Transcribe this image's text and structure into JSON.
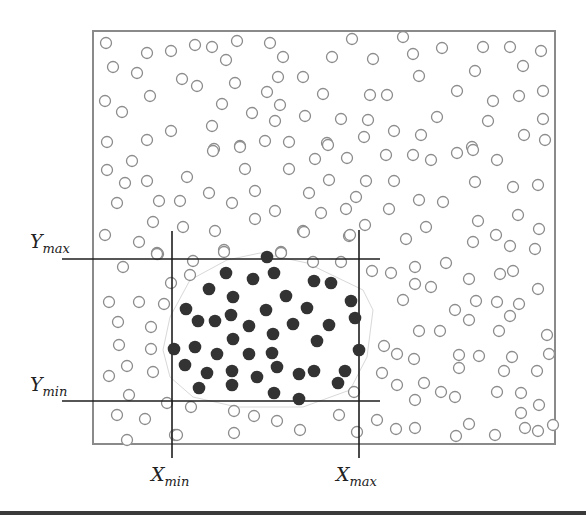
{
  "diagram": {
    "frame": {
      "x": 93,
      "y": 31,
      "w": 462,
      "h": 413,
      "stroke": "#8a8a8a"
    },
    "colors": {
      "open_stroke": "#8c8c8c",
      "filled": "#333333",
      "lines": "#1e1e1e",
      "hull": "#d8d8d8"
    },
    "dot_radius": 5.5,
    "labels": {
      "y_max": {
        "base": "Y",
        "sub": "max"
      },
      "y_min": {
        "base": "Y",
        "sub": "min"
      },
      "x_min": {
        "base": "X",
        "sub": "min"
      },
      "x_max": {
        "base": "X",
        "sub": "max"
      }
    },
    "bounds_lines": {
      "y_max": {
        "y": 259,
        "x1": 62,
        "x2": 380
      },
      "y_min": {
        "y": 401,
        "x1": 62,
        "x2": 380
      },
      "x_min": {
        "x": 172,
        "y1": 231,
        "y2": 458
      },
      "x_max": {
        "x": 359,
        "y1": 230,
        "y2": 458
      }
    },
    "hull_polygon": [
      [
        260,
        253
      ],
      [
        307,
        263
      ],
      [
        363,
        290
      ],
      [
        373,
        310
      ],
      [
        367,
        357
      ],
      [
        350,
        390
      ],
      [
        303,
        407
      ],
      [
        237,
        407
      ],
      [
        193,
        397
      ],
      [
        170,
        377
      ],
      [
        163,
        350
      ],
      [
        170,
        317
      ],
      [
        190,
        280
      ],
      [
        227,
        260
      ]
    ],
    "filled_points": [
      [
        267,
        257
      ],
      [
        226,
        273
      ],
      [
        253,
        279
      ],
      [
        274,
        273
      ],
      [
        314,
        281
      ],
      [
        331,
        283
      ],
      [
        209,
        289
      ],
      [
        233,
        297
      ],
      [
        286,
        296
      ],
      [
        351,
        301
      ],
      [
        186,
        309
      ],
      [
        266,
        310
      ],
      [
        307,
        308
      ],
      [
        198,
        321
      ],
      [
        215,
        321
      ],
      [
        231,
        315
      ],
      [
        249,
        326
      ],
      [
        293,
        324
      ],
      [
        329,
        325
      ],
      [
        355,
        318
      ],
      [
        233,
        339
      ],
      [
        273,
        334
      ],
      [
        317,
        341
      ],
      [
        174,
        349
      ],
      [
        195,
        347
      ],
      [
        217,
        354
      ],
      [
        249,
        354
      ],
      [
        272,
        353
      ],
      [
        359,
        350
      ],
      [
        185,
        365
      ],
      [
        277,
        367
      ],
      [
        207,
        373
      ],
      [
        232,
        371
      ],
      [
        257,
        377
      ],
      [
        299,
        374
      ],
      [
        314,
        371
      ],
      [
        345,
        371
      ],
      [
        199,
        388
      ],
      [
        232,
        385
      ],
      [
        338,
        383
      ],
      [
        274,
        393
      ],
      [
        299,
        399
      ]
    ],
    "open_points": [
      [
        106,
        43
      ],
      [
        147,
        53
      ],
      [
        171,
        51
      ],
      [
        195,
        45
      ],
      [
        212,
        47
      ],
      [
        237,
        41
      ],
      [
        270,
        43
      ],
      [
        283,
        57
      ],
      [
        226,
        60
      ],
      [
        113,
        67
      ],
      [
        137,
        73
      ],
      [
        182,
        79
      ],
      [
        197,
        86
      ],
      [
        235,
        83
      ],
      [
        278,
        77
      ],
      [
        303,
        77
      ],
      [
        323,
        94
      ],
      [
        267,
        92
      ],
      [
        280,
        105
      ],
      [
        150,
        96
      ],
      [
        105,
        101
      ],
      [
        122,
        112
      ],
      [
        222,
        104
      ],
      [
        252,
        113
      ],
      [
        275,
        121
      ],
      [
        305,
        116
      ],
      [
        171,
        131
      ],
      [
        212,
        126
      ],
      [
        107,
        142
      ],
      [
        147,
        140
      ],
      [
        214,
        149
      ],
      [
        240,
        146
      ],
      [
        265,
        141
      ],
      [
        289,
        142
      ],
      [
        327,
        143
      ],
      [
        352,
        39
      ],
      [
        403,
        37
      ],
      [
        332,
        57
      ],
      [
        373,
        59
      ],
      [
        413,
        54
      ],
      [
        442,
        48
      ],
      [
        483,
        47
      ],
      [
        510,
        47
      ],
      [
        541,
        51
      ],
      [
        523,
        66
      ],
      [
        475,
        71
      ],
      [
        419,
        76
      ],
      [
        370,
        95
      ],
      [
        387,
        95
      ],
      [
        457,
        91
      ],
      [
        493,
        101
      ],
      [
        519,
        96
      ],
      [
        543,
        91
      ],
      [
        341,
        119
      ],
      [
        368,
        120
      ],
      [
        437,
        117
      ],
      [
        488,
        121
      ],
      [
        543,
        119
      ],
      [
        364,
        137
      ],
      [
        394,
        131
      ],
      [
        421,
        135
      ],
      [
        524,
        135
      ],
      [
        545,
        140
      ],
      [
        472,
        147
      ],
      [
        213,
        151
      ],
      [
        240,
        147
      ],
      [
        132,
        161
      ],
      [
        107,
        170
      ],
      [
        245,
        169
      ],
      [
        289,
        169
      ],
      [
        315,
        159
      ],
      [
        125,
        183
      ],
      [
        147,
        181
      ],
      [
        187,
        177
      ],
      [
        209,
        193
      ],
      [
        255,
        191
      ],
      [
        309,
        193
      ],
      [
        117,
        203
      ],
      [
        159,
        201
      ],
      [
        180,
        201
      ],
      [
        232,
        203
      ],
      [
        275,
        211
      ],
      [
        255,
        219
      ],
      [
        153,
        222
      ],
      [
        183,
        227
      ],
      [
        215,
        231
      ],
      [
        303,
        231
      ],
      [
        105,
        235
      ],
      [
        139,
        242
      ],
      [
        157,
        253
      ],
      [
        224,
        250
      ],
      [
        281,
        252
      ],
      [
        328,
        145
      ],
      [
        347,
        158
      ],
      [
        386,
        155
      ],
      [
        413,
        155
      ],
      [
        431,
        160
      ],
      [
        457,
        153
      ],
      [
        473,
        150
      ],
      [
        497,
        160
      ],
      [
        329,
        180
      ],
      [
        366,
        181
      ],
      [
        394,
        181
      ],
      [
        475,
        182
      ],
      [
        513,
        187
      ],
      [
        538,
        185
      ],
      [
        356,
        197
      ],
      [
        419,
        200
      ],
      [
        443,
        202
      ],
      [
        321,
        213
      ],
      [
        346,
        209
      ],
      [
        389,
        209
      ],
      [
        518,
        215
      ],
      [
        478,
        221
      ],
      [
        365,
        225
      ],
      [
        426,
        227
      ],
      [
        539,
        229
      ],
      [
        349,
        236
      ],
      [
        406,
        239
      ],
      [
        473,
        242
      ],
      [
        496,
        235
      ],
      [
        510,
        246
      ],
      [
        535,
        249
      ],
      [
        372,
        271
      ],
      [
        391,
        273
      ],
      [
        415,
        267
      ],
      [
        446,
        263
      ],
      [
        500,
        274
      ],
      [
        513,
        271
      ],
      [
        469,
        279
      ],
      [
        415,
        284
      ],
      [
        431,
        287
      ],
      [
        538,
        289
      ],
      [
        403,
        300
      ],
      [
        476,
        301
      ],
      [
        497,
        302
      ],
      [
        519,
        304
      ],
      [
        455,
        310
      ],
      [
        510,
        316
      ],
      [
        469,
        320
      ],
      [
        419,
        331
      ],
      [
        440,
        331
      ],
      [
        499,
        331
      ],
      [
        547,
        335
      ],
      [
        384,
        346
      ],
      [
        397,
        354
      ],
      [
        414,
        359
      ],
      [
        459,
        355
      ],
      [
        479,
        356
      ],
      [
        512,
        357
      ],
      [
        549,
        354
      ],
      [
        382,
        373
      ],
      [
        459,
        368
      ],
      [
        504,
        371
      ],
      [
        537,
        371
      ],
      [
        397,
        385
      ],
      [
        424,
        383
      ],
      [
        441,
        392
      ],
      [
        455,
        397
      ],
      [
        497,
        392
      ],
      [
        521,
        393
      ],
      [
        415,
        400
      ],
      [
        539,
        405
      ],
      [
        521,
        413
      ],
      [
        377,
        420
      ],
      [
        396,
        429
      ],
      [
        415,
        428
      ],
      [
        469,
        424
      ],
      [
        525,
        428
      ],
      [
        538,
        431
      ],
      [
        553,
        425
      ],
      [
        456,
        436
      ],
      [
        495,
        435
      ],
      [
        158,
        254
      ],
      [
        123,
        267
      ],
      [
        171,
        283
      ],
      [
        109,
        302
      ],
      [
        139,
        302
      ],
      [
        164,
        304
      ],
      [
        118,
        322
      ],
      [
        151,
        327
      ],
      [
        119,
        345
      ],
      [
        151,
        349
      ],
      [
        127,
        366
      ],
      [
        153,
        372
      ],
      [
        109,
        376
      ],
      [
        129,
        395
      ],
      [
        167,
        403
      ],
      [
        117,
        415
      ],
      [
        145,
        419
      ],
      [
        175,
        435
      ],
      [
        127,
        440
      ],
      [
        191,
        407
      ],
      [
        234,
        411
      ],
      [
        254,
        416
      ],
      [
        277,
        421
      ],
      [
        339,
        415
      ],
      [
        354,
        392
      ],
      [
        177,
        435
      ],
      [
        234,
        433
      ],
      [
        300,
        430
      ],
      [
        357,
        432
      ],
      [
        157,
        254
      ],
      [
        193,
        261
      ],
      [
        224,
        252
      ],
      [
        281,
        253
      ],
      [
        313,
        262
      ],
      [
        341,
        262
      ],
      [
        190,
        275
      ],
      [
        350,
        235
      ],
      [
        304,
        232
      ]
    ]
  }
}
